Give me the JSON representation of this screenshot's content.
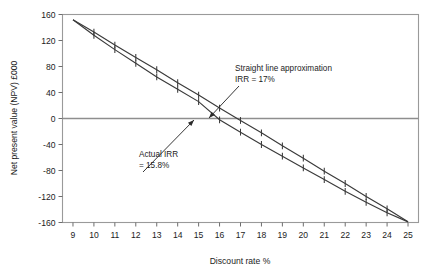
{
  "chart_data": {
    "type": "line",
    "title": "",
    "xlabel": "Discount rate %",
    "ylabel": "Net present value (NPV) £000",
    "xlim": [
      8.5,
      25.5
    ],
    "ylim": [
      -160,
      160
    ],
    "xticks": [
      9,
      10,
      11,
      12,
      13,
      14,
      15,
      16,
      17,
      18,
      19,
      20,
      21,
      22,
      23,
      24,
      25
    ],
    "yticks": [
      160,
      120,
      80,
      40,
      0,
      -40,
      -80,
      -120,
      -160
    ],
    "grid": false,
    "legend": "none",
    "zero_line": 0,
    "series": [
      {
        "name": "Straight line approximation",
        "style": "straight",
        "x": [
          9,
          10,
          11,
          12,
          13,
          14,
          15,
          16,
          17,
          18,
          19,
          20,
          21,
          22,
          23,
          24,
          25
        ],
        "values": [
          152,
          133,
          113,
          94,
          75,
          55,
          36,
          16,
          -3,
          -22,
          -42,
          -61,
          -81,
          -100,
          -120,
          -139,
          -159
        ]
      },
      {
        "name": "Actual NPV curve",
        "style": "actual",
        "x": [
          9,
          10,
          11,
          12,
          13,
          14,
          15,
          16,
          17,
          18,
          19,
          20,
          21,
          22,
          23,
          24,
          25
        ],
        "values": [
          152,
          128,
          106,
          85,
          64,
          45,
          26,
          -2,
          -21,
          -40,
          -58,
          -76,
          -94,
          -112,
          -129,
          -145,
          -159
        ]
      }
    ],
    "annotations": [
      {
        "id": "straight-line-annotation",
        "line1": "Straight line approximation",
        "line2": "IRR = 17%",
        "text_x": 235,
        "text_y": 71,
        "point_x": 209,
        "point_y": 118
      },
      {
        "id": "actual-irr-annotation",
        "line1": "Actual IRR",
        "line2": "= 15.8%",
        "text_x": 139,
        "text_y": 157,
        "point_x": 194,
        "point_y": 120
      }
    ]
  },
  "axes": {
    "x_title": "Discount rate %",
    "y_title": "Net present value (NPV) £000",
    "x_tick_labels": [
      "9",
      "10",
      "11",
      "12",
      "13",
      "14",
      "15",
      "16",
      "17",
      "18",
      "19",
      "20",
      "21",
      "22",
      "23",
      "24",
      "25"
    ],
    "y_tick_labels": [
      "160",
      "120",
      "80",
      "40",
      "0",
      "-40",
      "-80",
      "-120",
      "-160"
    ]
  },
  "colors": {
    "series": "#3a3a3a",
    "axis": "#8c8c8c",
    "text": "#1c1c1c",
    "background": "#ffffff"
  }
}
